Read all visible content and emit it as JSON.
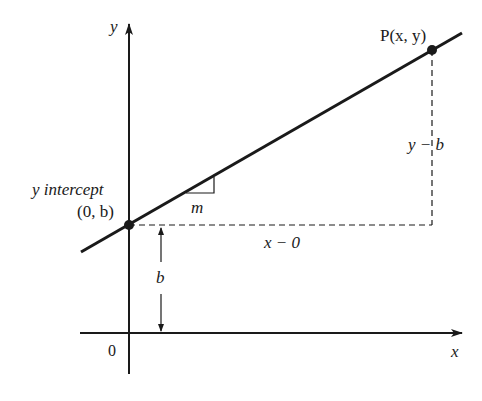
{
  "diagram": {
    "type": "slope-intercept line on cartesian axes",
    "colors": {
      "ink": "#1a1a1a",
      "background": "#ffffff"
    },
    "axes": {
      "x_label": "x",
      "y_label": "y",
      "origin_label": "0"
    },
    "points": {
      "intercept": {
        "label_line1": "y intercept",
        "label_line2": "(0, b)"
      },
      "p": {
        "label": "P(x, y)"
      }
    },
    "annotations": {
      "slope": "m",
      "rise": "y − b",
      "run": "x − 0",
      "intercept_height": "b"
    }
  }
}
